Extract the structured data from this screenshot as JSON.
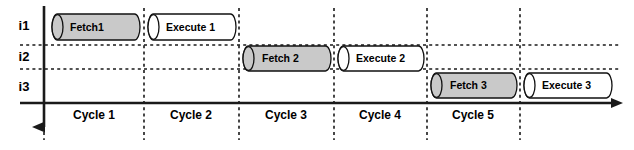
{
  "diagram": {
    "type": "pipeline-timing-diagram",
    "width": 634,
    "height": 150,
    "colors": {
      "fetch_fill": "#c9c9c9",
      "execute_fill": "#ffffff",
      "stroke": "#111111",
      "axis": "#1a1a1a",
      "background": "#ffffff"
    },
    "axes": {
      "time_axis": {
        "name": "horizontal-time-axis",
        "y": 103,
        "x_start": 20,
        "x_end": 624,
        "stroke_width": 2.6,
        "arrow": "right"
      },
      "instruction_axis": {
        "name": "vertical-instruction-axis",
        "x": 44,
        "y_start": 6,
        "y_end": 140,
        "stroke_width": 2.6,
        "arrow": "down"
      }
    },
    "rows": [
      {
        "label": "i1",
        "label_x": 24,
        "label_y": 30,
        "top": 10,
        "bottom": 45,
        "center_y": 27
      },
      {
        "label": "i2",
        "label_x": 24,
        "label_y": 61,
        "top": 45,
        "bottom": 69,
        "center_y": 57
      },
      {
        "label": "i3",
        "label_x": 24,
        "label_y": 91,
        "top": 69,
        "bottom": 103,
        "center_y": 87
      }
    ],
    "row_dividers": [
      {
        "y": 45,
        "x_start": 20,
        "x_end": 620
      },
      {
        "y": 69,
        "x_start": 20,
        "x_end": 620
      }
    ],
    "cycle_dividers": [
      {
        "x": 44,
        "y_start": 8,
        "y_end": 140
      },
      {
        "x": 144,
        "y_start": 8,
        "y_end": 140
      },
      {
        "x": 239,
        "y_start": 8,
        "y_end": 140
      },
      {
        "x": 334,
        "y_start": 8,
        "y_end": 140
      },
      {
        "x": 427,
        "y_start": 8,
        "y_end": 140
      },
      {
        "x": 520,
        "y_start": 8,
        "y_end": 140
      }
    ],
    "cycles": [
      {
        "label": "Cycle 1",
        "x_start": 44,
        "x_end": 144,
        "label_x": 94,
        "label_y": 119
      },
      {
        "label": "Cycle 2",
        "x_start": 144,
        "x_end": 239,
        "label_x": 191,
        "label_y": 119
      },
      {
        "label": "Cycle 3",
        "x_start": 239,
        "x_end": 334,
        "label_x": 286,
        "label_y": 119
      },
      {
        "label": "Cycle 4",
        "x_start": 334,
        "x_end": 427,
        "label_x": 380,
        "label_y": 119
      },
      {
        "label": "Cycle 5",
        "x_start": 427,
        "x_end": 520,
        "label_x": 473,
        "label_y": 119
      }
    ],
    "stages": [
      {
        "id": "fetch-1",
        "label": "Fetch1",
        "instruction": "i1",
        "cycle": "Cycle 1",
        "kind": "fetch",
        "fill": "#c9c9c9",
        "x": 52,
        "y": 14,
        "width": 88,
        "height": 26,
        "label_x": 70,
        "label_y": 31
      },
      {
        "id": "execute-1",
        "label": "Execute 1",
        "instruction": "i1",
        "cycle": "Cycle 2",
        "kind": "execute",
        "fill": "#ffffff",
        "x": 148,
        "y": 14,
        "width": 88,
        "height": 26,
        "label_x": 166,
        "label_y": 31
      },
      {
        "id": "fetch-2",
        "label": "Fetch 2",
        "instruction": "i2",
        "cycle": "Cycle 3",
        "kind": "fetch",
        "fill": "#c9c9c9",
        "x": 243,
        "y": 46,
        "width": 88,
        "height": 25,
        "label_x": 262,
        "label_y": 62
      },
      {
        "id": "execute-2",
        "label": "Execute 2",
        "instruction": "i2",
        "cycle": "Cycle 4",
        "kind": "execute",
        "fill": "#ffffff",
        "x": 338,
        "y": 46,
        "width": 86,
        "height": 25,
        "label_x": 356,
        "label_y": 62
      },
      {
        "id": "fetch-3",
        "label": "Fetch 3",
        "instruction": "i3",
        "cycle": "Cycle 5",
        "kind": "fetch",
        "fill": "#c9c9c9",
        "x": 431,
        "y": 73,
        "width": 86,
        "height": 25,
        "label_x": 450,
        "label_y": 89
      },
      {
        "id": "execute-3",
        "label": "Execute 3",
        "instruction": "i3",
        "cycle": "Cycle 6",
        "kind": "execute",
        "fill": "#ffffff",
        "x": 524,
        "y": 73,
        "width": 88,
        "height": 25,
        "label_x": 542,
        "label_y": 89
      }
    ]
  }
}
